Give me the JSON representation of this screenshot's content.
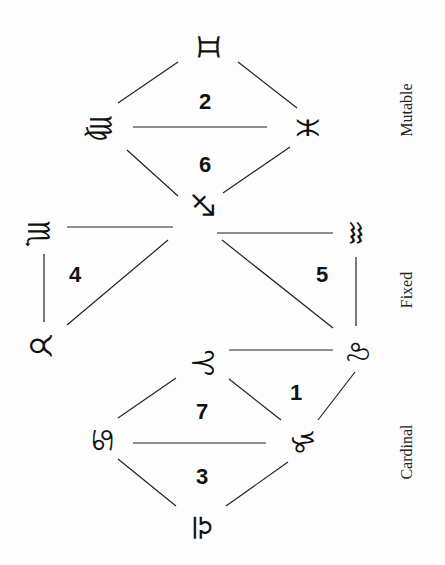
{
  "signs": [
    {
      "id": "gemini",
      "glyph": "♊",
      "x": 208,
      "y": 47
    },
    {
      "id": "virgo",
      "glyph": "♍",
      "x": 100,
      "y": 128
    },
    {
      "id": "pisces",
      "glyph": "♓",
      "x": 307,
      "y": 128
    },
    {
      "id": "sagittarius",
      "glyph": "♐",
      "x": 202,
      "y": 205
    },
    {
      "id": "scorpio",
      "glyph": "♏",
      "x": 38,
      "y": 234
    },
    {
      "id": "aquarius",
      "glyph": "♒",
      "x": 355,
      "y": 233
    },
    {
      "id": "taurus",
      "glyph": "♉",
      "x": 40,
      "y": 346
    },
    {
      "id": "leo",
      "glyph": "♌",
      "x": 357,
      "y": 352
    },
    {
      "id": "aries",
      "glyph": "♈",
      "x": 202,
      "y": 363
    },
    {
      "id": "cancer",
      "glyph": "♋",
      "x": 102,
      "y": 440
    },
    {
      "id": "capricorn",
      "glyph": "♑",
      "x": 302,
      "y": 442
    },
    {
      "id": "libra",
      "glyph": "♎",
      "x": 202,
      "y": 528
    }
  ],
  "numbers": [
    {
      "label": "2",
      "x": 205,
      "y": 102
    },
    {
      "label": "6",
      "x": 205,
      "y": 165
    },
    {
      "label": "4",
      "x": 75,
      "y": 275
    },
    {
      "label": "5",
      "x": 322,
      "y": 275
    },
    {
      "label": "1",
      "x": 296,
      "y": 393
    },
    {
      "label": "7",
      "x": 202,
      "y": 412
    },
    {
      "label": "3",
      "x": 202,
      "y": 477
    }
  ],
  "modalities": [
    {
      "label": "Mutable",
      "x": 407,
      "y": 110
    },
    {
      "label": "Fixed",
      "x": 407,
      "y": 290
    },
    {
      "label": "Cardinal",
      "x": 407,
      "y": 452
    }
  ],
  "edges": [
    [
      118,
      103,
      178,
      62
    ],
    [
      238,
      62,
      297,
      108
    ],
    [
      133,
      127,
      267,
      127
    ],
    [
      127,
      150,
      178,
      196
    ],
    [
      223,
      193,
      290,
      147
    ],
    [
      67,
      227,
      173,
      227
    ],
    [
      217,
      233,
      333,
      233
    ],
    [
      44,
      254,
      44,
      322
    ],
    [
      118,
      263,
      56,
      325
    ],
    [
      67,
      327,
      0,
      0
    ],
    [
      222,
      240,
      333,
      328
    ],
    [
      356,
      257,
      356,
      326
    ],
    [
      229,
      350,
      333,
      350
    ],
    [
      118,
      418,
      176,
      378
    ],
    [
      229,
      379,
      281,
      420
    ],
    [
      133,
      443,
      266,
      443
    ],
    [
      118,
      459,
      176,
      506
    ],
    [
      226,
      506,
      288,
      462
    ],
    [
      318,
      420,
      355,
      372
    ]
  ]
}
